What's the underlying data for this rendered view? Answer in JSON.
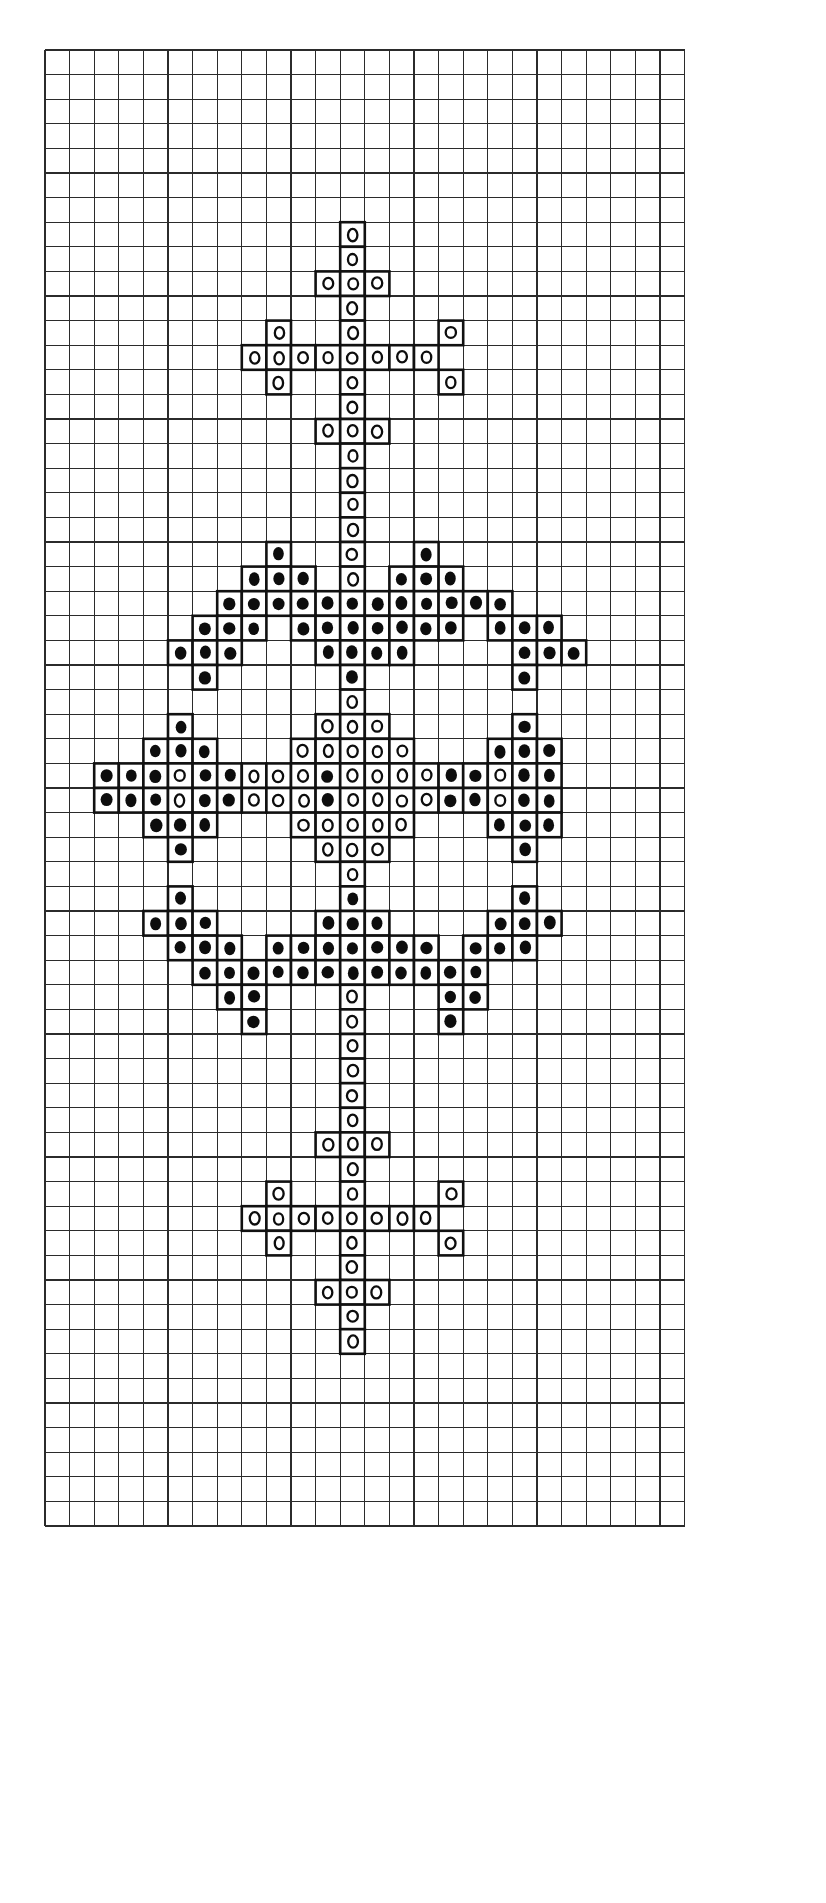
{
  "document": {
    "title": "Cross-Stitch Pattern Chart",
    "kind": "needlework-chart",
    "background_color": "#ffffff",
    "ink_color": "#0d0d0d",
    "grid_line_color": "#2b2b2b"
  },
  "grid": {
    "columns": 26,
    "rows": 60,
    "cell_size": 24.6,
    "origin_x": 43,
    "origin_y": 48,
    "show_grid_lines": true
  },
  "legend": {
    "symbols": [
      {
        "key": "F",
        "name": "filled-circle",
        "glyph": "●",
        "color": "#0d0d0d",
        "description": "solid stitch"
      },
      {
        "key": "O",
        "name": "open-circle",
        "glyph": "○",
        "color": "#ffffff",
        "description": "outline stitch"
      },
      {
        "key": ".",
        "name": "empty-cell",
        "glyph": "",
        "color": "#ffffff",
        "description": "no stitch"
      }
    ]
  },
  "chart_data": {
    "type": "heatmap",
    "xlabel": "",
    "ylabel": "",
    "grid": true,
    "legend_position": "none",
    "columns": 26,
    "rows": 60,
    "symbol_counts": {
      "filled": 186,
      "open": 114,
      "empty": 1260
    },
    "cells": [
      "..........................",
      "..........................",
      "............O.............",
      "............O.............",
      "...........OOO............",
      "............O.............",
      ".........O..O...O.........",
      "........OOOOOOOO..........",
      ".........O..O...O.........",
      "............O.............",
      "...........OOO............",
      "............O.............",
      "............O.............",
      "............O.............",
      "............O.............",
      ".........F..O..F..........",
      "........FFF.O.FFF.........",
      ".......FFFFFFFFFFFF.......",
      "......FFF.FFFFFFF.FFF.....",
      ".....FFF...FFFF....FFF....",
      "......F.....F......F......",
      "............O.............",
      ".....F.....OOO.....F......",
      "....FFF...OOOOO...FFF.....",
      "..FFFOFFOOOFOOOOFFOFF.....",
      "..FFFOFFOOOFOOOOFFOFF.....",
      "....FFF...OOOOO...FFF.....",
      ".....F.....OOO.....F......",
      "............O.............",
      ".....F......F......F......",
      "....FFF....FFF....FFF.....",
      ".....FFF.FFFFFFF.FFF......",
      "......FFFFFFFFFFFF........",
      ".......FF...O...FF........",
      "........F...O...F.........",
      "............O.............",
      "............O.............",
      "............O.............",
      "............O.............",
      "...........OOO............",
      "............O.............",
      ".........O..O...O.........",
      "........OOOOOOOO..........",
      ".........O..O...O.........",
      "............O.............",
      "...........OOO............",
      "............O.............",
      "............O.............",
      "..........................",
      ".........................."
    ],
    "sections": [
      {
        "name": "top-cross-finial",
        "rows": "2-14",
        "symbol": "open-circle"
      },
      {
        "name": "upper-leaf-spray",
        "rows": "15-20",
        "symbol": "filled-circle"
      },
      {
        "name": "central-diamond-medallion",
        "rows": "22-28",
        "symbol": "mixed"
      },
      {
        "name": "lower-leaf-spray",
        "rows": "29-34",
        "symbol": "filled-circle"
      },
      {
        "name": "bottom-cross-finial",
        "rows": "35-47",
        "symbol": "open-circle"
      }
    ]
  }
}
